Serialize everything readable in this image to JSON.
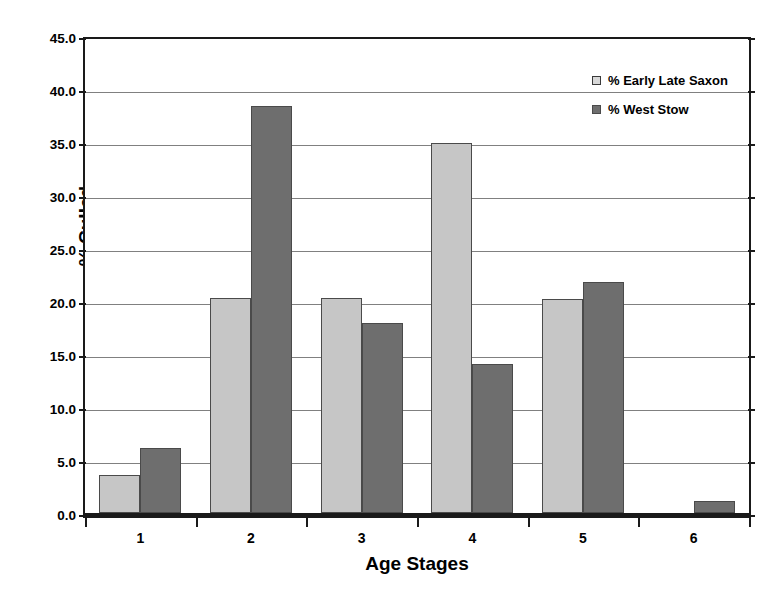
{
  "chart_data": {
    "type": "bar",
    "title": "",
    "xlabel": "Age Stages",
    "ylabel": "% Culled",
    "categories": [
      "1",
      "2",
      "3",
      "4",
      "5",
      "6"
    ],
    "series": [
      {
        "name": "% Early Late Saxon",
        "color": "#c6c6c6",
        "values": [
          3.6,
          20.3,
          20.3,
          34.9,
          20.2,
          0.0
        ]
      },
      {
        "name": "% West Stow",
        "color": "#6e6e6e",
        "values": [
          6.1,
          38.4,
          17.9,
          14.1,
          21.8,
          1.1
        ]
      }
    ],
    "ylim": [
      0.0,
      45.0
    ],
    "ytick_step": 5.0,
    "ytick_labels": [
      "0.0",
      "5.0",
      "10.0",
      "15.0",
      "20.0",
      "25.0",
      "30.0",
      "35.0",
      "40.0",
      "45.0"
    ],
    "grid": true,
    "grid_axis": "y",
    "legend_position": "top-right",
    "bar_border_color": "#4a4a4a",
    "axis_color": "#1a1a1a",
    "gridline_color": "#808080",
    "background": "#ffffff"
  }
}
